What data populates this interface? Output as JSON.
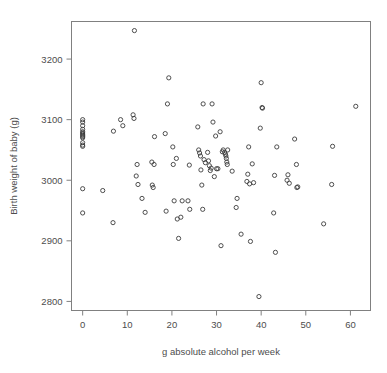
{
  "chart_data": {
    "type": "scatter",
    "title": "",
    "subtitle": "",
    "xlabel": "g absolute alcohol per week",
    "ylabel": "Birth weight of baby (g)",
    "xlim": [
      -2.5,
      64.5
    ],
    "ylim": [
      2785,
      3262
    ],
    "xticks": [
      0,
      10,
      20,
      30,
      40,
      50,
      60
    ],
    "xticklabels": [
      "0",
      "10",
      "20",
      "30",
      "40",
      "50",
      "60"
    ],
    "yticks": [
      2800,
      2900,
      3000,
      3100,
      3200
    ],
    "yticklabels": [
      "2800",
      "2900",
      "3000",
      "3100",
      "3200"
    ],
    "grid": false,
    "legend": null,
    "marker": "open-circle",
    "marker_color": "#3c3c3c",
    "frame_color": "#808080",
    "background": "#ffffff",
    "n_points": 106,
    "series": [
      {
        "name": "babies",
        "x": [
          0,
          0,
          0,
          0,
          0,
          0,
          0,
          0,
          0,
          0,
          0,
          0,
          0,
          0,
          0,
          4.5,
          6.8,
          6.9,
          8.5,
          9.0,
          11.3,
          11.5,
          11.6,
          12.0,
          12.2,
          12.4,
          13.3,
          14.0,
          15.5,
          15.6,
          15.8,
          16.0,
          16.1,
          18.5,
          18.7,
          19.0,
          19.3,
          20.2,
          20.3,
          20.5,
          21.0,
          21.2,
          21.5,
          22.0,
          22.3,
          23.6,
          23.9,
          24.0,
          25.8,
          26.0,
          26.2,
          26.4,
          26.5,
          26.7,
          26.9,
          27.0,
          27.2,
          27.5,
          28.0,
          28.2,
          28.4,
          28.6,
          28.8,
          29.0,
          29.2,
          29.5,
          29.8,
          30.0,
          30.3,
          30.8,
          31.0,
          31.3,
          31.5,
          31.8,
          32.0,
          32.1,
          32.2,
          32.3,
          32.4,
          32.5,
          33.5,
          34.4,
          34.6,
          35.5,
          36.8,
          37.0,
          37.2,
          37.4,
          37.6,
          38.0,
          38.3,
          39.5,
          39.8,
          40.0,
          40.2,
          40.3,
          42.8,
          43.0,
          43.2,
          43.5,
          45.8,
          46.0,
          46.3,
          47.5,
          47.9,
          48.0,
          48.2,
          54.0,
          55.8,
          56.0,
          61.2
        ],
        "y": [
          3100,
          3096,
          3090,
          3084,
          3080,
          3078,
          3076,
          3074,
          3072,
          3070,
          3062,
          3058,
          3056,
          2986,
          2946,
          2983,
          2930,
          3081,
          3100,
          3090,
          3108,
          3102,
          3247,
          3007,
          3026,
          2993,
          2970,
          2947,
          3030,
          2992,
          2988,
          3026,
          3072,
          3077,
          2949,
          3126,
          3169,
          3055,
          3026,
          2966,
          3036,
          2936,
          2904,
          2939,
          2966,
          2966,
          3025,
          2952,
          3088,
          3050,
          3045,
          3040,
          3017,
          2992,
          2952,
          3126,
          3034,
          3029,
          3046,
          3032,
          3024,
          3016,
          3020,
          3126,
          3096,
          3006,
          3073,
          3019,
          3019,
          3080,
          2892,
          3047,
          3050,
          3046,
          3043,
          3040,
          3036,
          3030,
          3026,
          3050,
          3015,
          2955,
          2970,
          2911,
          2998,
          3010,
          3055,
          2994,
          2899,
          3027,
          2996,
          2808,
          3086,
          3161,
          3120,
          3119,
          2946,
          3008,
          2881,
          3055,
          3000,
          3009,
          2995,
          3068,
          3026,
          2988,
          2989,
          2928,
          2993,
          3056,
          3122
        ]
      }
    ]
  },
  "axes": {
    "x_axis_name": "x-axis",
    "y_axis_name": "y-axis"
  }
}
